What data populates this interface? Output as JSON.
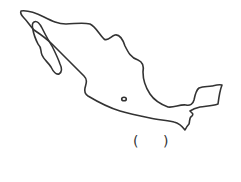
{
  "map": {
    "subject": "Mexico outline",
    "stroke_color": "#333333",
    "background": "#ffffff",
    "marker": {
      "label": "city-dot",
      "x": 124,
      "y": 99
    }
  },
  "answer_blank": {
    "open": "(",
    "close": ")"
  }
}
